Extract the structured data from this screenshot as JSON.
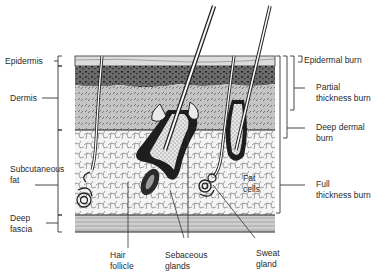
{
  "diagram": {
    "type": "skin-cross-section",
    "left_labels": {
      "epidermis": "Epidermis",
      "dermis": "Dermis",
      "subcutaneous_fat": [
        "Subcutaneous",
        "fat"
      ],
      "deep_fascia": [
        "Deep",
        "fascia"
      ]
    },
    "bottom_labels": {
      "hair_follicle": [
        "Hair",
        "follicle"
      ],
      "sebaceous_glands": [
        "Sebaceous",
        "glands"
      ],
      "sweat_gland": [
        "Sweat",
        "gland"
      ]
    },
    "inner_labels": {
      "fat_cells": [
        "Fat",
        "cells"
      ]
    },
    "right_labels": {
      "epidermal_burn": "Epidermal burn",
      "partial_thickness_burn": [
        "Partial",
        "thickness burn"
      ],
      "deep_dermal_burn": [
        "Deep dermal",
        "burn"
      ],
      "full_thickness_burn": [
        "Full",
        "thickness burn"
      ]
    },
    "colors": {
      "ink": "#1a1a1a",
      "epidermis": "#d8d8d8",
      "dark_dermis": "#5a5a5a",
      "dermis": "#bdbdbd",
      "fat": "#f2f2f2",
      "fascia": "#c8c8c8"
    }
  }
}
